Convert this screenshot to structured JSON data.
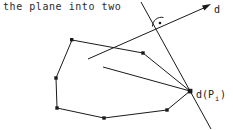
{
  "figure": {
    "caption": "the plane into two",
    "labels": {
      "line_d": "d",
      "projection_point_prefix": "d(P",
      "projection_point_subscript": "i",
      "projection_point_suffix": ")"
    },
    "colors": {
      "stroke": "#1a1a1a",
      "text": "#2b2b2b",
      "background": "#ffffff"
    },
    "polygon": {
      "name": "convex-polygon",
      "vertices": [
        [
          72,
          40
        ],
        [
          143,
          53
        ],
        [
          190,
          91
        ],
        [
          167,
          110
        ],
        [
          104,
          118
        ],
        [
          57,
          108
        ],
        [
          56,
          78
        ]
      ],
      "vertex_marker": "square-dot"
    },
    "line_d": {
      "name": "directed-line-d",
      "from": [
        88,
        59
      ],
      "to": [
        209,
        6
      ],
      "arrow_head": true
    },
    "perpendicular_line": {
      "name": "perpendicular-line",
      "from": [
        141,
        2
      ],
      "to": [
        211,
        129
      ]
    },
    "interior_segment": {
      "name": "interior-segment",
      "from": [
        103,
        67
      ],
      "to": [
        190,
        91
      ]
    },
    "right_angle_marker": {
      "name": "right-angle-marker",
      "center": [
        159,
        23
      ],
      "dot": [
        165,
        29
      ]
    }
  }
}
